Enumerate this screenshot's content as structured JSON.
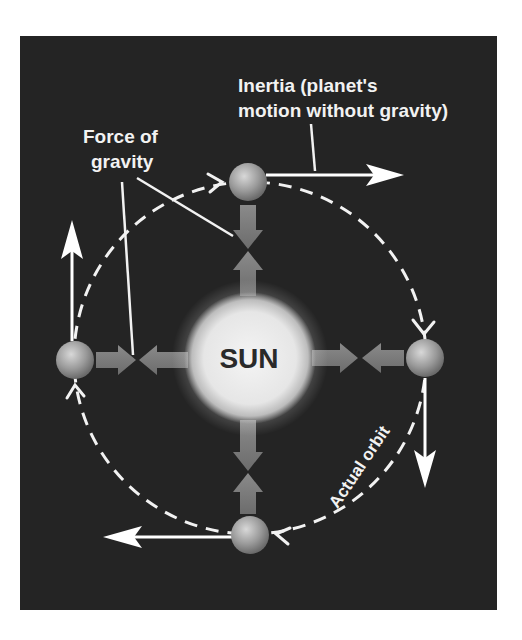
{
  "diagram": {
    "type": "orbital-mechanics",
    "colors": {
      "background_panel": "#242424",
      "page_background": "#ffffff",
      "text": "#f2f2f2",
      "sun_label": "#2a2a2a",
      "arrows_white": "#ffffff",
      "gravity_arrows": "#8a8a8a"
    },
    "labels": {
      "sun": "SUN",
      "inertia_line1": "Inertia (planet's",
      "inertia_line2": "motion without gravity)",
      "gravity_line1": "Force of",
      "gravity_line2": "gravity",
      "orbit": "Actual orbit"
    },
    "nodes": [
      {
        "id": "sun",
        "label": "SUN",
        "x": 250,
        "y": 358,
        "r": 63
      },
      {
        "id": "planet-top",
        "x": 248,
        "y": 182,
        "r": 19
      },
      {
        "id": "planet-right",
        "x": 425,
        "y": 358,
        "r": 19
      },
      {
        "id": "planet-bottom",
        "x": 250,
        "y": 535,
        "r": 19
      },
      {
        "id": "planet-left",
        "x": 75,
        "y": 360,
        "r": 19
      }
    ],
    "edges": [
      {
        "from": "planet-top",
        "to": "east",
        "kind": "inertia"
      },
      {
        "from": "planet-right",
        "to": "south",
        "kind": "inertia"
      },
      {
        "from": "planet-bottom",
        "to": "west",
        "kind": "inertia"
      },
      {
        "from": "planet-left",
        "to": "north",
        "kind": "inertia"
      },
      {
        "from": "planet-top",
        "to": "sun",
        "kind": "gravity"
      },
      {
        "from": "planet-right",
        "to": "sun",
        "kind": "gravity"
      },
      {
        "from": "planet-bottom",
        "to": "sun",
        "kind": "gravity"
      },
      {
        "from": "planet-left",
        "to": "sun",
        "kind": "gravity"
      },
      {
        "from": "orbit",
        "direction": "clockwise",
        "kind": "actual-orbit"
      }
    ]
  }
}
